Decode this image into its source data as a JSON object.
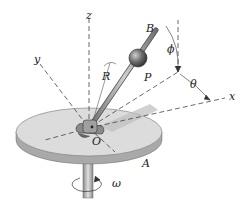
{
  "diagram": {
    "type": "dynamics-figure",
    "labels": {
      "z": "z",
      "y": "y",
      "x": "x",
      "B": "B",
      "phi": "ϕ",
      "theta": "θ",
      "R": "R",
      "P": "P",
      "O": "O",
      "A": "A",
      "omega": "ω"
    },
    "colors": {
      "disk_top": "#d9d9d9",
      "disk_edge": "#a8a8a8",
      "shaft": "#b0b0b0",
      "ball": "#6a6a6a",
      "rod": "#8c8c8c",
      "dashed_axis": "#444444"
    }
  }
}
